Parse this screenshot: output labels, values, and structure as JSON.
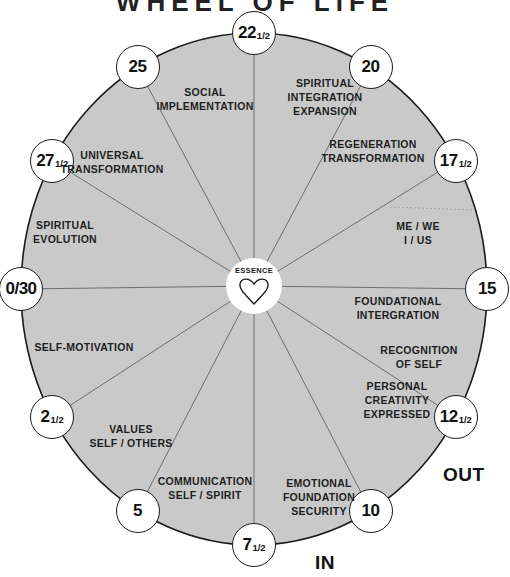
{
  "title": "WHEEL OF LIFE",
  "center": {
    "label": "ESSENCE",
    "icon": "heart-icon"
  },
  "colors": {
    "wheel_fill": "#c9c9c9",
    "outline": "#1a1a1a",
    "spoke": "#6e6e6e",
    "node_fill": "#ffffff"
  },
  "nodes": [
    {
      "main": "22",
      "frac": "1/2"
    },
    {
      "main": "20",
      "frac": ""
    },
    {
      "main": "17",
      "frac": "1/2"
    },
    {
      "main": "15",
      "frac": ""
    },
    {
      "main": "12",
      "frac": "1/2"
    },
    {
      "main": "10",
      "frac": ""
    },
    {
      "main": "7",
      "frac": "1/2"
    },
    {
      "main": "5",
      "frac": ""
    },
    {
      "main": "2",
      "frac": "1/2"
    },
    {
      "main": "0/30",
      "frac": ""
    },
    {
      "main": "27",
      "frac": "1/2"
    },
    {
      "main": "25",
      "frac": ""
    }
  ],
  "segments": [
    {
      "lines": [
        "SPIRITUAL",
        "INTEGRATION",
        "EXPANSION"
      ]
    },
    {
      "lines": [
        "REGENERATION",
        "TRANSFORMATION"
      ]
    },
    {
      "lines": [
        "ME / WE",
        "I / US"
      ]
    },
    {
      "lines": [
        "FOUNDATIONAL",
        "INTERGRATION"
      ]
    },
    {
      "lines": [
        "RECOGNITION",
        "OF SELF"
      ]
    },
    {
      "lines": [
        "PERSONAL",
        "CREATIVITY",
        "EXPRESSED"
      ]
    },
    {
      "lines": [
        "EMOTIONAL",
        "FOUNDATION",
        "SECURITY"
      ]
    },
    {
      "lines": [
        "COMMUNICATION",
        "SELF / SPIRIT"
      ]
    },
    {
      "lines": [
        "VALUES",
        "SELF / OTHERS"
      ]
    },
    {
      "lines": [
        "SELF-MOTIVATION"
      ]
    },
    {
      "lines": [
        "SPIRITUAL",
        "EVOLUTION"
      ]
    },
    {
      "lines": [
        "UNIVERSAL",
        "TRANSFORMATION"
      ]
    },
    {
      "lines": [
        "SOCIAL",
        "IMPLEMENTATION"
      ]
    }
  ],
  "direction_labels": {
    "out": "OUT",
    "in": "IN"
  }
}
